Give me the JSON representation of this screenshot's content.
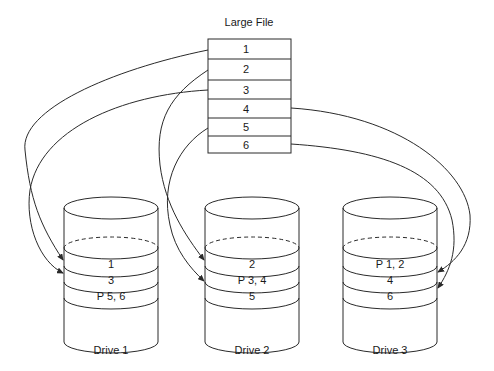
{
  "diagram": {
    "title": "Large File",
    "file_blocks": [
      "1",
      "2",
      "3",
      "4",
      "5",
      "6"
    ],
    "drives": [
      {
        "label": "Drive 1",
        "blocks": [
          "1",
          "3",
          "P 5, 6"
        ]
      },
      {
        "label": "Drive 2",
        "blocks": [
          "2",
          "P 3, 4",
          "5"
        ]
      },
      {
        "label": "Drive 3",
        "blocks": [
          "P 1, 2",
          "4",
          "6"
        ]
      }
    ],
    "arrows": [
      {
        "from": "1",
        "to": "Drive 1 block 1"
      },
      {
        "from": "2",
        "to": "Drive 2 block 2"
      },
      {
        "from": "3",
        "to": "Drive 1 block 3"
      },
      {
        "from": "4",
        "to": "Drive 3 block 4"
      },
      {
        "from": "5",
        "to": "Drive 2 block 5"
      },
      {
        "from": "6",
        "to": "Drive 3 block 6"
      }
    ],
    "colors": {
      "line": "#2a2a2a",
      "text": "#1a1a1a",
      "background": "#ffffff"
    }
  }
}
